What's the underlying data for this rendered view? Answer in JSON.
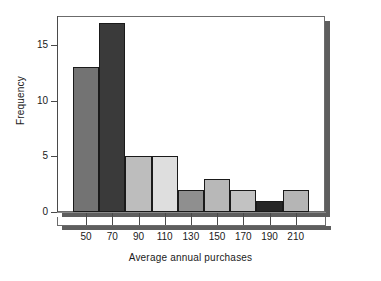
{
  "chart_data": {
    "type": "bar",
    "title": "",
    "subtitle": "",
    "xlabel": "Average annual purchases",
    "ylabel": "Frequency",
    "categories": [
      "50",
      "70",
      "90",
      "110",
      "130",
      "150",
      "170",
      "190",
      "210"
    ],
    "values": [
      13,
      17,
      5,
      5,
      2,
      3,
      2,
      1,
      2
    ],
    "bar_colors": [
      "#737373",
      "#3a3a3a",
      "#bdbdbd",
      "#dedede",
      "#8f8f8f",
      "#b8b8b8",
      "#c2c2c2",
      "#262626",
      "#b5b5b5"
    ],
    "bar_outline_color": "#1a1a1a",
    "ylim": [
      0,
      17.5
    ],
    "yticks": [
      0,
      5,
      10,
      15
    ],
    "ytick_labels": [
      "0",
      "5",
      "10",
      "15"
    ],
    "xtick_labels": [
      "50",
      "70",
      "90",
      "110",
      "130",
      "150",
      "170",
      "190",
      "210"
    ],
    "grid": false,
    "legend": null,
    "legend_position": "none",
    "annotations": []
  },
  "axes": {
    "y_axis_title": "Frequency",
    "x_axis_title": "Average annual purchases"
  }
}
